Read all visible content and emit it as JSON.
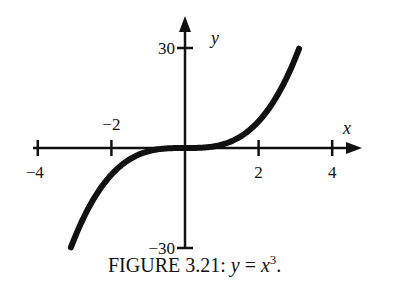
{
  "chart_data": {
    "type": "line",
    "function": "y = x^3",
    "xlabel": "x",
    "ylabel": "y",
    "xlim": [
      -4.2,
      4.6
    ],
    "ylim": [
      -30,
      33
    ],
    "x_ticks": [
      -4,
      -2,
      2,
      4
    ],
    "x_tick_labels": [
      "−4",
      "−2",
      "2",
      "4"
    ],
    "y_ticks": [
      30,
      -30
    ],
    "y_tick_labels": [
      "30",
      "−30"
    ],
    "grid": false,
    "legend": null,
    "x": [
      -3.1,
      -3.0,
      -2.5,
      -2.0,
      -1.5,
      -1.0,
      -0.5,
      0.0,
      0.5,
      1.0,
      1.5,
      2.0,
      2.5,
      3.0,
      3.1
    ],
    "y": [
      -29.79,
      -27.0,
      -15.63,
      -8.0,
      -3.38,
      -1.0,
      -0.13,
      0.0,
      0.13,
      1.0,
      3.38,
      8.0,
      15.63,
      27.0,
      29.79
    ],
    "x_domain": [
      -3.1,
      3.1
    ]
  },
  "caption": {
    "prefix": "FIGURE 3.21: ",
    "equation_lhs": "y",
    "equation_eq": " = ",
    "equation_base": "x",
    "equation_exp": "3",
    "suffix": "."
  },
  "colors": {
    "ink": "#111111",
    "background": "#ffffff"
  }
}
